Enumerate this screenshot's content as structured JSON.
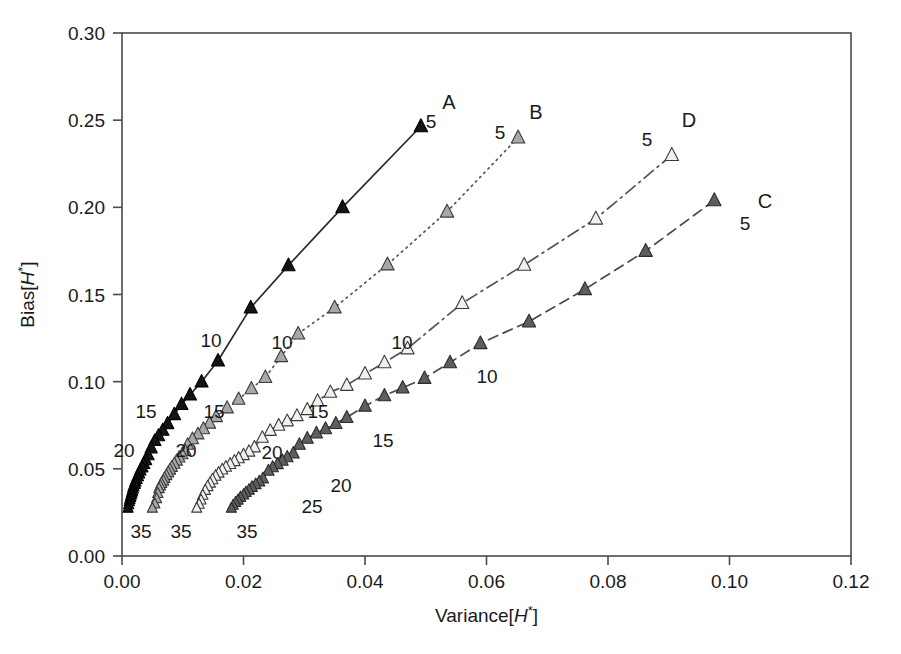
{
  "chart_data": {
    "type": "line",
    "title": "",
    "xlabel": "Variance[H*]",
    "ylabel": "Bias[H*]",
    "xlim": [
      0.0,
      0.12
    ],
    "ylim": [
      0.0,
      0.3
    ],
    "grid": false,
    "legend_position": "inline-end-of-line",
    "xticks": [
      "0.00",
      "0.02",
      "0.04",
      "0.06",
      "0.08",
      "0.10",
      "0.12"
    ],
    "xtick_values": [
      0.0,
      0.02,
      0.04,
      0.06,
      0.08,
      0.1,
      0.12
    ],
    "yticks": [
      "0.00",
      "0.05",
      "0.10",
      "0.15",
      "0.20",
      "0.25",
      "0.30"
    ],
    "ytick_values": [
      0.0,
      0.05,
      0.1,
      0.15,
      0.2,
      0.25,
      0.3
    ],
    "point_annotations": [
      "5",
      "10",
      "15",
      "20",
      "25",
      "35"
    ],
    "series": [
      {
        "name": "A",
        "label": "A",
        "marker": "triangle-up",
        "marker_fill": "#141414",
        "marker_edge": "#000000",
        "line_style": "solid",
        "line_color": "#2b2b2b",
        "annotated_points": [
          {
            "n": 5,
            "x": 0.0492,
            "y": 0.2465
          },
          {
            "n": 10,
            "x": 0.0158,
            "y": 0.112
          },
          {
            "n": 15,
            "x": 0.0075,
            "y": 0.076
          },
          {
            "n": 20,
            "x": 0.0043,
            "y": 0.058
          },
          {
            "n": 35,
            "x": 0.001,
            "y": 0.0275
          }
        ],
        "x": [
          0.0492,
          0.0363,
          0.0274,
          0.0212,
          0.0158,
          0.0131,
          0.0112,
          0.0098,
          0.0086,
          0.0075,
          0.0067,
          0.006,
          0.0054,
          0.0048,
          0.0043,
          0.0039,
          0.0036,
          0.0033,
          0.003,
          0.0028,
          0.0026,
          0.0024,
          0.0022,
          0.0021,
          0.0019,
          0.0018,
          0.0017,
          0.0016,
          0.0015,
          0.0014,
          0.0013,
          0.0012,
          0.0011,
          0.001
        ],
        "y": [
          0.2465,
          0.2,
          0.1667,
          0.1425,
          0.112,
          0.1,
          0.0925,
          0.087,
          0.0812,
          0.076,
          0.0722,
          0.069,
          0.0662,
          0.062,
          0.058,
          0.0552,
          0.053,
          0.051,
          0.0492,
          0.0475,
          0.0458,
          0.0442,
          0.0428,
          0.0414,
          0.04,
          0.0387,
          0.0374,
          0.0362,
          0.035,
          0.0338,
          0.0325,
          0.0312,
          0.0295,
          0.0275
        ]
      },
      {
        "name": "B",
        "label": "B",
        "marker": "triangle-up",
        "marker_fill": "#a8a8a8",
        "marker_edge": "#3a3a3a",
        "line_style": "dotted",
        "line_color": "#555555",
        "annotated_points": [
          {
            "n": 5,
            "x": 0.0652,
            "y": 0.24
          },
          {
            "n": 10,
            "x": 0.0262,
            "y": 0.1145
          },
          {
            "n": 15,
            "x": 0.0155,
            "y": 0.08
          },
          {
            "n": 20,
            "x": 0.0104,
            "y": 0.0605
          },
          {
            "n": 35,
            "x": 0.005,
            "y": 0.0275
          }
        ],
        "x": [
          0.0652,
          0.0535,
          0.0437,
          0.035,
          0.029,
          0.0262,
          0.0236,
          0.0213,
          0.0192,
          0.0173,
          0.0155,
          0.0144,
          0.0134,
          0.0125,
          0.0116,
          0.0108,
          0.0104,
          0.0099,
          0.0094,
          0.009,
          0.0086,
          0.0082,
          0.0079,
          0.0076,
          0.0073,
          0.007,
          0.0068,
          0.0065,
          0.0063,
          0.0061,
          0.0059,
          0.0057,
          0.0054,
          0.005
        ],
        "y": [
          0.24,
          0.1975,
          0.1672,
          0.1425,
          0.1275,
          0.1145,
          0.1025,
          0.096,
          0.09,
          0.085,
          0.08,
          0.0762,
          0.073,
          0.07,
          0.0672,
          0.064,
          0.0605,
          0.0585,
          0.0566,
          0.0548,
          0.053,
          0.0512,
          0.0496,
          0.048,
          0.0464,
          0.0448,
          0.0432,
          0.0418,
          0.0404,
          0.0388,
          0.036,
          0.033,
          0.03,
          0.0275
        ]
      },
      {
        "name": "D",
        "label": "D",
        "marker": "triangle-up",
        "marker_fill": "#f0f0f0",
        "marker_edge": "#3a3a3a",
        "line_style": "dashdot",
        "line_color": "#555555",
        "annotated_points": [
          {
            "n": 5,
            "x": 0.0905,
            "y": 0.23
          },
          {
            "n": 10,
            "x": 0.047,
            "y": 0.119
          },
          {
            "n": 15,
            "x": 0.0305,
            "y": 0.084
          },
          {
            "n": 20,
            "x": 0.0218,
            "y": 0.0625
          },
          {
            "n": 35,
            "x": 0.0123,
            "y": 0.0275
          }
        ],
        "x": [
          0.0905,
          0.078,
          0.0662,
          0.056,
          0.047,
          0.0432,
          0.04,
          0.037,
          0.0343,
          0.0322,
          0.0305,
          0.0288,
          0.0272,
          0.0258,
          0.0244,
          0.0231,
          0.0218,
          0.0209,
          0.02,
          0.0192,
          0.0185,
          0.0178,
          0.0171,
          0.0165,
          0.0159,
          0.0154,
          0.0149,
          0.0145,
          0.0141,
          0.0137,
          0.0133,
          0.013,
          0.0127,
          0.0123
        ],
        "y": [
          0.23,
          0.1935,
          0.167,
          0.145,
          0.119,
          0.111,
          0.1045,
          0.098,
          0.094,
          0.089,
          0.084,
          0.0805,
          0.0775,
          0.075,
          0.072,
          0.068,
          0.0625,
          0.06,
          0.058,
          0.0562,
          0.0545,
          0.0528,
          0.0512,
          0.0496,
          0.0478,
          0.046,
          0.044,
          0.042,
          0.04,
          0.0378,
          0.035,
          0.0322,
          0.0298,
          0.0275
        ]
      },
      {
        "name": "C",
        "label": "C",
        "marker": "triangle-up",
        "marker_fill": "#5e5e5e",
        "marker_edge": "#2b2b2b",
        "line_style": "dashed",
        "line_color": "#4a4a4a",
        "annotated_points": [
          {
            "n": 5,
            "x": 0.0975,
            "y": 0.204
          },
          {
            "n": 10,
            "x": 0.054,
            "y": 0.111
          },
          {
            "n": 15,
            "x": 0.037,
            "y": 0.0795
          },
          {
            "n": 20,
            "x": 0.0282,
            "y": 0.059
          },
          {
            "n": 25,
            "x": 0.0232,
            "y": 0.0445
          },
          {
            "n": 35,
            "x": 0.018,
            "y": 0.0275
          }
        ],
        "x": [
          0.0975,
          0.0862,
          0.0762,
          0.067,
          0.059,
          0.054,
          0.0498,
          0.0462,
          0.0432,
          0.04,
          0.037,
          0.0352,
          0.0335,
          0.032,
          0.0305,
          0.0292,
          0.0282,
          0.0272,
          0.0264,
          0.0256,
          0.0248,
          0.0241,
          0.0232,
          0.0226,
          0.022,
          0.0214,
          0.0209,
          0.0204,
          0.02,
          0.0195,
          0.0191,
          0.0187,
          0.0183,
          0.018
        ],
        "y": [
          0.204,
          0.175,
          0.153,
          0.1345,
          0.122,
          0.111,
          0.102,
          0.0965,
          0.092,
          0.086,
          0.0795,
          0.076,
          0.073,
          0.0705,
          0.0675,
          0.064,
          0.059,
          0.0568,
          0.0548,
          0.0528,
          0.051,
          0.049,
          0.0445,
          0.0428,
          0.0412,
          0.0396,
          0.038,
          0.0366,
          0.0352,
          0.0338,
          0.0322,
          0.0308,
          0.0292,
          0.0275
        ]
      }
    ],
    "inline_annotations": [
      {
        "series": "A",
        "text": "5",
        "x": 431,
        "y": 128
      },
      {
        "series": "A",
        "text": "10",
        "x": 211,
        "y": 347
      },
      {
        "series": "A",
        "text": "15",
        "x": 146,
        "y": 418
      },
      {
        "series": "A",
        "text": "20",
        "x": 124,
        "y": 457
      },
      {
        "series": "A",
        "text": "35",
        "x": 141,
        "y": 538
      },
      {
        "series": "B",
        "text": "5",
        "x": 500,
        "y": 139
      },
      {
        "series": "B",
        "text": "10",
        "x": 282,
        "y": 349
      },
      {
        "series": "B",
        "text": "15",
        "x": 214,
        "y": 418
      },
      {
        "series": "B",
        "text": "20",
        "x": 186,
        "y": 457
      },
      {
        "series": "B",
        "text": "35",
        "x": 181,
        "y": 538
      },
      {
        "series": "D",
        "text": "5",
        "x": 647,
        "y": 146
      },
      {
        "series": "D",
        "text": "10",
        "x": 402,
        "y": 349
      },
      {
        "series": "D",
        "text": "15",
        "x": 318,
        "y": 418
      },
      {
        "series": "D",
        "text": "20",
        "x": 272,
        "y": 459
      },
      {
        "series": "D",
        "text": "35",
        "x": 247,
        "y": 538
      },
      {
        "series": "C",
        "text": "5",
        "x": 745,
        "y": 230
      },
      {
        "series": "C",
        "text": "10",
        "x": 487,
        "y": 383
      },
      {
        "series": "C",
        "text": "15",
        "x": 383,
        "y": 447
      },
      {
        "series": "C",
        "text": "20",
        "x": 341,
        "y": 492
      },
      {
        "series": "C",
        "text": "25",
        "x": 312,
        "y": 513
      }
    ],
    "series_labels": [
      {
        "text": "A",
        "x": 449,
        "y": 109
      },
      {
        "text": "B",
        "x": 536,
        "y": 119
      },
      {
        "text": "D",
        "x": 689,
        "y": 127
      },
      {
        "text": "C",
        "x": 765,
        "y": 208
      }
    ]
  },
  "caption": {
    "partial_line": ""
  }
}
